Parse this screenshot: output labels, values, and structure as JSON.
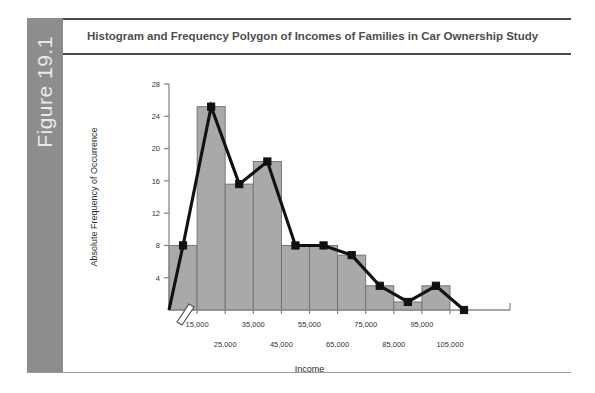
{
  "figure": {
    "number_label": "Figure 19.1",
    "title": "Histogram and Frequency Polygon of Incomes of Families in Car Ownership Study"
  },
  "colors": {
    "band_gray": "#8d8d8d",
    "band_text": "#e9e9e9",
    "rule": "#4a4a4a",
    "title_text": "#4d4d4d",
    "bar_fill": "#a9a9a9",
    "bar_stroke": "#6f6f6f",
    "polygon_line": "#111111",
    "axis": "#8a8a8a"
  },
  "chart_data": {
    "type": "bar",
    "title": "Histogram and Frequency Polygon of Incomes of Families in Car Ownership Study",
    "xlabel": "Income",
    "ylabel": "Absolute Frequency of Occurrence",
    "grid": false,
    "legend": "none",
    "axis_break": true,
    "ylim": [
      0,
      28
    ],
    "yticks": [
      4,
      8,
      12,
      16,
      20,
      24,
      28
    ],
    "ytick_labels": [
      "4",
      "8",
      "12",
      "16",
      "20",
      "24",
      "28"
    ],
    "categories": [
      "15,000",
      "25,000",
      "35,000",
      "45,000",
      "55,000",
      "65,000",
      "75,000",
      "85,000",
      "95,000",
      "105,000"
    ],
    "xtick_labels_row_top": [
      "15,000",
      "35,000",
      "55,000",
      "75,000",
      "95,000"
    ],
    "xtick_labels_row_bottom": [
      "25,000",
      "45,000",
      "65,000",
      "85,000",
      "105,000"
    ],
    "values": [
      8,
      25.2,
      15.6,
      18.4,
      8,
      8,
      6.8,
      3,
      1,
      3
    ],
    "series": [
      {
        "name": "Histogram (Absolute Frequency)",
        "type": "bar",
        "values": [
          8,
          25.2,
          15.6,
          18.4,
          8,
          8,
          6.8,
          3,
          1,
          3
        ]
      },
      {
        "name": "Frequency Polygon",
        "type": "line",
        "x": [
          "5,000",
          "15,000",
          "25,000",
          "35,000",
          "45,000",
          "55,000",
          "65,000",
          "75,000",
          "85,000",
          "95,000",
          "105,000",
          "115,000"
        ],
        "values": [
          0,
          8,
          25.2,
          15.6,
          18.4,
          8,
          8,
          6.8,
          3,
          1,
          3,
          0
        ]
      }
    ]
  }
}
